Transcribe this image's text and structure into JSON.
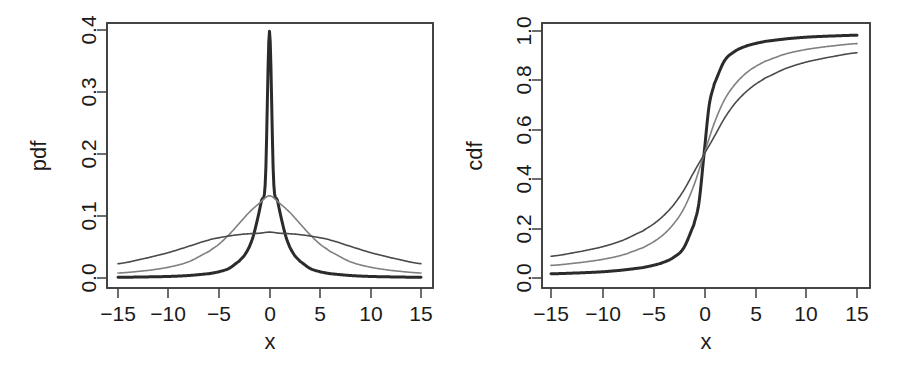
{
  "figure": {
    "background": "#ffffff",
    "foreground": "#1a1a1a",
    "width": 899,
    "height": 382,
    "panels": 2
  },
  "left_panel": {
    "name": "pdf-panel",
    "ylabel": "pdf",
    "xlabel": "x",
    "x_tick_labels": [
      "−15",
      "−10",
      "−5",
      "0",
      "5",
      "10",
      "15"
    ],
    "y_tick_labels": [
      "0.0",
      "0.1",
      "0.2",
      "0.3",
      "0.4"
    ]
  },
  "right_panel": {
    "name": "cdf-panel",
    "ylabel": "cdf",
    "xlabel": "x",
    "x_tick_labels": [
      "−15",
      "−10",
      "−5",
      "0",
      "5",
      "10",
      "15"
    ],
    "y_tick_labels": [
      "0.0",
      "0.2",
      "0.4",
      "0.6",
      "0.8",
      "1.0"
    ]
  },
  "chart_data": [
    {
      "type": "line",
      "title": "",
      "xlabel": "x",
      "ylabel": "pdf",
      "xlim": [
        -15,
        15
      ],
      "ylim": [
        0.0,
        0.4
      ],
      "xticks": [
        -15,
        -10,
        -5,
        0,
        5,
        10,
        15
      ],
      "yticks": [
        0.0,
        0.1,
        0.2,
        0.3,
        0.4
      ],
      "grid": false,
      "legend": "none",
      "distribution": "cauchy",
      "series": [
        {
          "name": "narrow-pdf",
          "scale": 0.8,
          "location": 0,
          "color": "#2b2b2b",
          "stroke_width": 3.0,
          "peak_value": 0.398,
          "x": [
            -15,
            -12,
            -10,
            -8,
            -6,
            -5,
            -4,
            -3,
            -2.5,
            -2,
            -1.6,
            -1.2,
            -0.8,
            -0.4,
            0,
            0.4,
            0.8,
            1.2,
            1.6,
            2,
            2.5,
            3,
            4,
            5,
            6,
            8,
            10,
            12,
            15
          ],
          "y": [
            0.0011,
            0.0018,
            0.0025,
            0.004,
            0.007,
            0.0101,
            0.0156,
            0.0272,
            0.0362,
            0.0501,
            0.068,
            0.094,
            0.1243,
            0.1591,
            0.3979,
            0.1591,
            0.1243,
            0.094,
            0.068,
            0.0501,
            0.0362,
            0.0272,
            0.0156,
            0.0101,
            0.007,
            0.004,
            0.0025,
            0.0018,
            0.0011
          ]
        },
        {
          "name": "medium-pdf",
          "scale": 2.4,
          "location": 0,
          "color": "#808080",
          "stroke_width": 1.6,
          "peak_value": 0.133,
          "x": [
            -15,
            -12,
            -10,
            -8,
            -6,
            -5,
            -4,
            -3,
            -2,
            -1,
            0,
            1,
            2,
            3,
            4,
            5,
            6,
            8,
            10,
            12,
            15
          ],
          "y": [
            0.008,
            0.0123,
            0.0174,
            0.0262,
            0.0427,
            0.0546,
            0.07,
            0.088,
            0.106,
            0.1206,
            0.1326,
            0.1206,
            0.106,
            0.088,
            0.07,
            0.0546,
            0.0427,
            0.0262,
            0.0174,
            0.0123,
            0.008
          ]
        },
        {
          "name": "wide-pdf",
          "scale": 4.3,
          "location": 0,
          "color": "#4a4a4a",
          "stroke_width": 1.6,
          "peak_value": 0.074,
          "x": [
            -15,
            -12,
            -10,
            -8,
            -6,
            -5,
            -4,
            -3,
            -2,
            -1,
            0,
            1,
            2,
            3,
            4,
            5,
            6,
            8,
            10,
            12,
            15
          ],
          "y": [
            0.023,
            0.0327,
            0.041,
            0.0511,
            0.0611,
            0.0649,
            0.0678,
            0.07,
            0.0714,
            0.0722,
            0.074,
            0.0722,
            0.0714,
            0.07,
            0.0678,
            0.0649,
            0.0611,
            0.0511,
            0.041,
            0.0327,
            0.023
          ]
        }
      ]
    },
    {
      "type": "line",
      "title": "",
      "xlabel": "x",
      "ylabel": "cdf",
      "xlim": [
        -15,
        15
      ],
      "ylim": [
        0.0,
        1.0
      ],
      "xticks": [
        -15,
        -10,
        -5,
        0,
        5,
        10,
        15
      ],
      "yticks": [
        0.0,
        0.2,
        0.4,
        0.6,
        0.8,
        1.0
      ],
      "grid": false,
      "legend": "none",
      "distribution": "cauchy",
      "series": [
        {
          "name": "narrow-cdf",
          "scale": 0.8,
          "location": 0,
          "color": "#2b2b2b",
          "stroke_width": 3.0,
          "x": [
            -15,
            -12,
            -10,
            -8,
            -6,
            -5,
            -4,
            -3,
            -2,
            -1,
            -0.5,
            0,
            0.5,
            1,
            2,
            3,
            4,
            5,
            6,
            8,
            10,
            12,
            15
          ],
          "y": [
            0.017,
            0.021,
            0.025,
            0.032,
            0.042,
            0.051,
            0.063,
            0.083,
            0.121,
            0.215,
            0.303,
            0.5,
            0.697,
            0.785,
            0.879,
            0.917,
            0.937,
            0.949,
            0.958,
            0.968,
            0.975,
            0.979,
            0.983
          ]
        },
        {
          "name": "medium-cdf",
          "scale": 2.4,
          "location": 0,
          "color": "#808080",
          "stroke_width": 1.6,
          "x": [
            -15,
            -12,
            -10,
            -8,
            -6,
            -5,
            -4,
            -3,
            -2,
            -1,
            0,
            1,
            2,
            3,
            4,
            5,
            6,
            8,
            10,
            12,
            15
          ],
          "y": [
            0.051,
            0.063,
            0.075,
            0.093,
            0.122,
            0.145,
            0.175,
            0.218,
            0.279,
            0.374,
            0.5,
            0.626,
            0.721,
            0.782,
            0.825,
            0.855,
            0.878,
            0.907,
            0.925,
            0.937,
            0.949
          ]
        },
        {
          "name": "wide-cdf",
          "scale": 4.3,
          "location": 0,
          "color": "#4a4a4a",
          "stroke_width": 1.6,
          "x": [
            -15,
            -12,
            -10,
            -8,
            -6,
            -5,
            -4,
            -3,
            -2,
            -1,
            0,
            1,
            2,
            3,
            4,
            5,
            6,
            8,
            10,
            12,
            15
          ],
          "y": [
            0.088,
            0.108,
            0.126,
            0.152,
            0.19,
            0.217,
            0.251,
            0.295,
            0.354,
            0.428,
            0.5,
            0.572,
            0.646,
            0.705,
            0.749,
            0.783,
            0.81,
            0.848,
            0.874,
            0.892,
            0.912
          ]
        }
      ]
    }
  ]
}
